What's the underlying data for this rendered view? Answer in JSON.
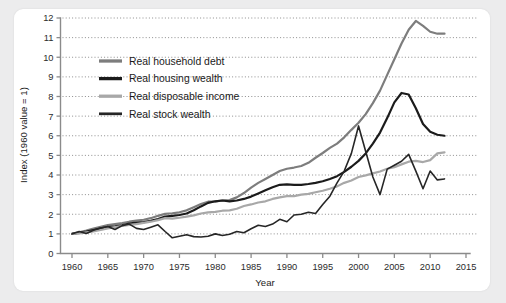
{
  "chart_data": {
    "type": "line",
    "title": "",
    "xlabel": "Year",
    "ylabel": "Index (1960 value = 1)",
    "xlim": [
      1960,
      2015
    ],
    "ylim": [
      0,
      12
    ],
    "grid": true,
    "legend_position": "top-left-inside",
    "xticks": [
      "1960",
      "1965",
      "1970",
      "1975",
      "1980",
      "1985",
      "1990",
      "1995",
      "2000",
      "2005",
      "2010",
      "2015"
    ],
    "yticks": [
      "0",
      "1",
      "2",
      "3",
      "4",
      "5",
      "6",
      "7",
      "8",
      "9",
      "10",
      "11",
      "12"
    ],
    "x": [
      1960,
      1961,
      1962,
      1963,
      1964,
      1965,
      1966,
      1967,
      1968,
      1969,
      1970,
      1971,
      1972,
      1973,
      1974,
      1975,
      1976,
      1977,
      1978,
      1979,
      1980,
      1981,
      1982,
      1983,
      1984,
      1985,
      1986,
      1987,
      1988,
      1989,
      1990,
      1991,
      1992,
      1993,
      1994,
      1995,
      1996,
      1997,
      1998,
      1999,
      2000,
      2001,
      2002,
      2003,
      2004,
      2005,
      2006,
      2007,
      2008,
      2009,
      2010,
      2011,
      2012
    ],
    "series": [
      {
        "name": "Real household debt",
        "color": "#7d7d7d",
        "width": 2.2,
        "values": [
          1.0,
          1.08,
          1.17,
          1.27,
          1.36,
          1.45,
          1.5,
          1.55,
          1.62,
          1.68,
          1.72,
          1.8,
          1.92,
          2.02,
          2.05,
          2.1,
          2.2,
          2.36,
          2.52,
          2.64,
          2.66,
          2.7,
          2.72,
          2.86,
          3.08,
          3.36,
          3.6,
          3.8,
          4.0,
          4.2,
          4.32,
          4.38,
          4.46,
          4.62,
          4.88,
          5.12,
          5.38,
          5.6,
          5.92,
          6.3,
          6.66,
          7.1,
          7.66,
          8.3,
          9.1,
          9.9,
          10.7,
          11.4,
          11.85,
          11.6,
          11.3,
          11.2,
          11.2
        ]
      },
      {
        "name": "Real housing wealth",
        "color": "#1b1b1b",
        "width": 2.2,
        "values": [
          1.0,
          1.05,
          1.12,
          1.2,
          1.28,
          1.34,
          1.38,
          1.44,
          1.52,
          1.58,
          1.6,
          1.66,
          1.76,
          1.88,
          1.92,
          1.96,
          2.04,
          2.2,
          2.4,
          2.58,
          2.66,
          2.7,
          2.66,
          2.7,
          2.78,
          2.9,
          3.06,
          3.22,
          3.38,
          3.5,
          3.52,
          3.5,
          3.5,
          3.54,
          3.6,
          3.68,
          3.8,
          3.94,
          4.16,
          4.42,
          4.72,
          5.1,
          5.6,
          6.16,
          6.9,
          7.7,
          8.18,
          8.1,
          7.4,
          6.6,
          6.2,
          6.05,
          6.0
        ]
      },
      {
        "name": "Real disposable income",
        "color": "#a8a8a8",
        "width": 2.2,
        "values": [
          1.0,
          1.03,
          1.08,
          1.12,
          1.2,
          1.28,
          1.34,
          1.4,
          1.46,
          1.5,
          1.56,
          1.62,
          1.7,
          1.8,
          1.78,
          1.82,
          1.88,
          1.94,
          2.04,
          2.1,
          2.12,
          2.18,
          2.2,
          2.28,
          2.42,
          2.5,
          2.6,
          2.66,
          2.78,
          2.86,
          2.92,
          2.92,
          3.0,
          3.04,
          3.12,
          3.2,
          3.3,
          3.42,
          3.6,
          3.72,
          3.9,
          3.98,
          4.08,
          4.18,
          4.32,
          4.4,
          4.54,
          4.68,
          4.72,
          4.66,
          4.76,
          5.1,
          5.15
        ]
      },
      {
        "name": "Real stock wealth",
        "color": "#262626",
        "width": 1.6,
        "values": [
          1.0,
          1.12,
          1.02,
          1.18,
          1.3,
          1.38,
          1.22,
          1.42,
          1.5,
          1.28,
          1.22,
          1.34,
          1.46,
          1.12,
          0.8,
          0.88,
          0.96,
          0.86,
          0.84,
          0.88,
          1.0,
          0.92,
          0.98,
          1.12,
          1.06,
          1.26,
          1.44,
          1.38,
          1.5,
          1.74,
          1.62,
          1.96,
          2.0,
          2.1,
          2.04,
          2.5,
          2.92,
          3.6,
          4.2,
          5.1,
          6.5,
          5.2,
          3.9,
          3.0,
          4.3,
          4.5,
          4.7,
          5.05,
          4.2,
          3.3,
          4.2,
          3.75,
          3.8
        ]
      }
    ]
  }
}
